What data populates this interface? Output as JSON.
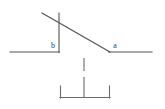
{
  "figure": {
    "background_color": "#ffffff",
    "stroke_color": "#555555",
    "label_color": "#3a3a3a",
    "width": 165,
    "height": 109,
    "labels": {
      "angle_b": "b",
      "angle_a": "a"
    },
    "geometry": {
      "left_ground_line": {
        "x1": 10,
        "y1": 52,
        "x2": 59,
        "y2": 52
      },
      "right_ground_line": {
        "x1": 109,
        "y1": 52,
        "x2": 152,
        "y2": 52
      },
      "vertical_line": {
        "x1": 59,
        "y1": 13,
        "x2": 59,
        "y2": 52
      },
      "incline_line": {
        "x1": 42,
        "y1": 13,
        "x2": 110,
        "y2": 52
      },
      "dashed_drop_line": {
        "x1": 84,
        "y1": 58,
        "x2": 84,
        "y2": 97,
        "gap_from": 71,
        "gap_to": 77
      },
      "bracket_base_line": {
        "x1": 60,
        "y1": 98,
        "x2": 110,
        "y2": 98
      },
      "bracket_left_tick": {
        "x1": 60,
        "y1": 86,
        "x2": 60,
        "y2": 98
      },
      "bracket_right_tick": {
        "x1": 110,
        "y1": 86,
        "x2": 110,
        "y2": 98
      },
      "angle_b_label_pos": {
        "x": 53,
        "y": 47
      },
      "angle_a_label_pos": {
        "x": 115,
        "y": 47
      }
    }
  }
}
